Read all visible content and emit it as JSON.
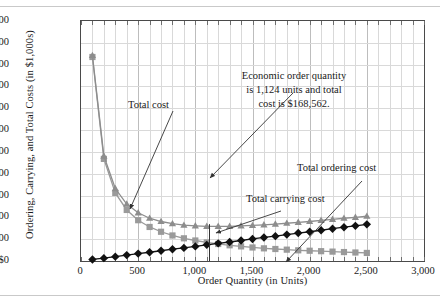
{
  "figure": {
    "xlabel": "Order Quantity (in Units)",
    "ylabel": "Ordering, Carrying, and Total Costs (in $1,000s)",
    "annotation": {
      "line1": "Economic order quantity",
      "line2": "is 1,124 units and total",
      "line3": "cost is $168,562."
    },
    "labels": {
      "total_cost": "Total cost",
      "total_carrying_cost": "Total carrying cost",
      "total_ordering_cost": "Total ordering cost"
    }
  },
  "chart_data": {
    "type": "line",
    "title": "",
    "xlabel": "Order Quantity (in Units)",
    "ylabel": "Ordering, Carrying, and Total Costs (in $1,000s)",
    "xlim": [
      0,
      3000
    ],
    "ylim": [
      0,
      1100
    ],
    "xticks": [
      0,
      500,
      1000,
      1500,
      2000,
      2500,
      3000
    ],
    "xtick_labels": [
      "0",
      "500",
      "1,000",
      "1,500",
      "2,000",
      "2,500",
      "3,000"
    ],
    "yticks": [
      0,
      100,
      200,
      300,
      400,
      500,
      600,
      700,
      800,
      900,
      1000,
      1100
    ],
    "ytick_labels": [
      "$0",
      "$100",
      "$200",
      "$300",
      "$400",
      "$500",
      "$600",
      "$700",
      "$800",
      "$900",
      "$1,000",
      "$1,100"
    ],
    "grid": true,
    "legend": "none (series labeled inline with leader lines)",
    "x": [
      100,
      200,
      300,
      400,
      500,
      600,
      700,
      800,
      900,
      1000,
      1100,
      1200,
      1300,
      1400,
      1500,
      1600,
      1700,
      1800,
      1900,
      2000,
      2100,
      2200,
      2300,
      2400,
      2500
    ],
    "series": [
      {
        "name": "Total ordering cost",
        "marker": "square",
        "color": "#9a9a9a",
        "values": [
          935,
          468,
          312,
          234,
          187,
          156,
          134,
          117,
          104,
          94,
          85,
          78,
          72,
          67,
          62,
          58,
          55,
          52,
          49,
          47,
          45,
          43,
          41,
          39,
          37
        ]
      },
      {
        "name": "Total carrying cost",
        "marker": "diamond",
        "color": "#111111",
        "values": [
          7,
          13,
          20,
          27,
          34,
          40,
          47,
          54,
          60,
          67,
          74,
          81,
          87,
          94,
          101,
          108,
          114,
          121,
          128,
          134,
          141,
          148,
          155,
          161,
          168
        ]
      },
      {
        "name": "Total cost",
        "marker": "triangle",
        "color": "#8d8d8d",
        "values": [
          942,
          481,
          332,
          261,
          221,
          196,
          181,
          171,
          164,
          161,
          159,
          159,
          159,
          161,
          163,
          166,
          169,
          173,
          177,
          181,
          186,
          191,
          196,
          200,
          205
        ]
      }
    ],
    "annotations": [
      {
        "text": "Economic order quantity is 1,124 units and total cost is $168,562.",
        "points_to_x": 1124,
        "points_to_y": 169
      },
      {
        "text": "Total cost",
        "points_to_x": 900,
        "points_to_y": 215
      },
      {
        "text": "Total carrying cost",
        "points_to_x": 1850,
        "points_to_y": 130
      },
      {
        "text": "Total ordering cost",
        "points_to_x": 2400,
        "points_to_y": 40
      }
    ],
    "eoq_marker": {
      "x": 1124,
      "y_top": 169,
      "y_bottom": 0
    }
  }
}
